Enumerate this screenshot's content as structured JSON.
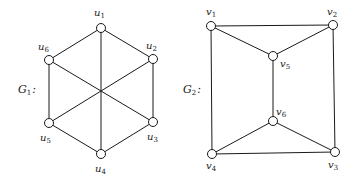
{
  "graphs": [
    {
      "name": "G1",
      "label": {
        "main": "G",
        "sub": "1",
        "suffix": ":",
        "x": 18,
        "y": 93
      },
      "nodes": [
        {
          "id": "u1",
          "main": "u",
          "sub": "1",
          "x": 101,
          "y": 28,
          "lx": 94,
          "ly": 16
        },
        {
          "id": "u2",
          "main": "u",
          "sub": "2",
          "x": 153,
          "y": 59,
          "lx": 146,
          "ly": 49
        },
        {
          "id": "u3",
          "main": "u",
          "sub": "3",
          "x": 153,
          "y": 122,
          "lx": 147,
          "ly": 140
        },
        {
          "id": "u4",
          "main": "u",
          "sub": "4",
          "x": 101,
          "y": 154,
          "lx": 95,
          "ly": 172
        },
        {
          "id": "u5",
          "main": "u",
          "sub": "5",
          "x": 49,
          "y": 123,
          "lx": 40,
          "ly": 141
        },
        {
          "id": "u6",
          "main": "u",
          "sub": "6",
          "x": 49,
          "y": 60,
          "lx": 38,
          "ly": 50
        }
      ],
      "edges": [
        [
          "u1",
          "u2"
        ],
        [
          "u2",
          "u3"
        ],
        [
          "u3",
          "u4"
        ],
        [
          "u4",
          "u5"
        ],
        [
          "u5",
          "u6"
        ],
        [
          "u6",
          "u1"
        ],
        [
          "u1",
          "u4"
        ],
        [
          "u2",
          "u5"
        ],
        [
          "u3",
          "u6"
        ]
      ]
    },
    {
      "name": "G2",
      "label": {
        "main": "G",
        "sub": "2",
        "suffix": ":",
        "x": 183,
        "y": 93
      },
      "nodes": [
        {
          "id": "v1",
          "main": "v",
          "sub": "1",
          "x": 211,
          "y": 26,
          "lx": 206,
          "ly": 15
        },
        {
          "id": "v2",
          "main": "v",
          "sub": "2",
          "x": 333,
          "y": 25,
          "lx": 327,
          "ly": 15
        },
        {
          "id": "v3",
          "main": "v",
          "sub": "3",
          "x": 335,
          "y": 152,
          "lx": 328,
          "ly": 168
        },
        {
          "id": "v4",
          "main": "v",
          "sub": "4",
          "x": 212,
          "y": 154,
          "lx": 206,
          "ly": 169
        },
        {
          "id": "v5",
          "main": "v",
          "sub": "5",
          "x": 273,
          "y": 56,
          "lx": 280,
          "ly": 67
        },
        {
          "id": "v6",
          "main": "v",
          "sub": "6",
          "x": 273,
          "y": 121,
          "lx": 276,
          "ly": 115
        }
      ],
      "edges": [
        [
          "v1",
          "v2"
        ],
        [
          "v2",
          "v3"
        ],
        [
          "v3",
          "v4"
        ],
        [
          "v4",
          "v1"
        ],
        [
          "v1",
          "v5"
        ],
        [
          "v2",
          "v5"
        ],
        [
          "v5",
          "v6"
        ],
        [
          "v6",
          "v4"
        ],
        [
          "v6",
          "v3"
        ]
      ]
    }
  ]
}
